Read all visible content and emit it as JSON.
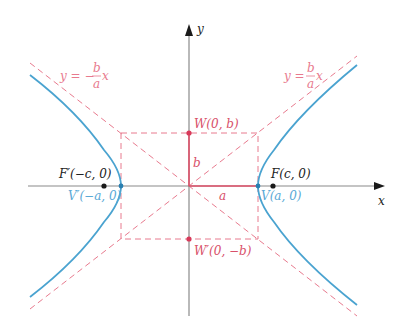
{
  "colors": {
    "axis": "#8a8a8a",
    "axis_arrow": "#1a1a1a",
    "hyperbola": "#4aa3d0",
    "construction": "#e87a8e",
    "segment": "#e0506a",
    "point_dark": "#1a1a1a",
    "point_red": "#d83a5a",
    "point_blue": "#2a7fb0",
    "label_dark": "#222222",
    "label_red": "#d8506a",
    "label_blue": "#5aa9d6"
  },
  "axes": {
    "x_label": "x",
    "y_label": "y"
  },
  "asymptotes": {
    "negative_label": {
      "lhs": "y = −",
      "num": "b",
      "den": "a",
      "var": "x"
    },
    "positive_label": {
      "lhs": "y = ",
      "num": "b",
      "den": "a",
      "var": "x"
    }
  },
  "points": {
    "W": "W(0, b)",
    "W_prime": "W′(0, −b)",
    "V": "V(a, 0)",
    "V_prime": "V′(−a, 0)",
    "F": "F(c, 0)",
    "F_prime": "F′(−c, 0)"
  },
  "segments": {
    "a": "a",
    "b": "b"
  }
}
